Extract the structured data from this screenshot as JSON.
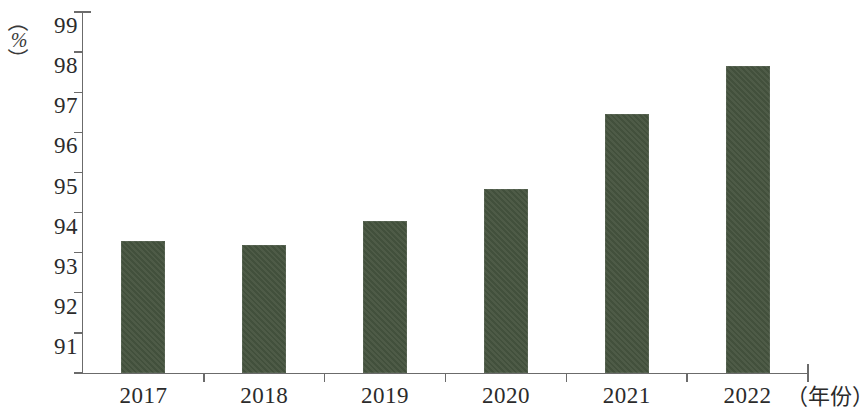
{
  "chart_data": {
    "type": "bar",
    "title": "",
    "xlabel": "（年份）",
    "ylabel": "（%）",
    "categories": [
      "2017",
      "2018",
      "2019",
      "2020",
      "2021",
      "2022"
    ],
    "values": [
      94.3,
      94.2,
      94.8,
      95.6,
      97.45,
      98.65
    ],
    "series": [
      {
        "name": "",
        "values": [
          94.3,
          94.2,
          94.8,
          95.6,
          97.45,
          98.65
        ]
      }
    ],
    "ylim": [
      91,
      100
    ],
    "ytick_labels": [
      "91",
      "92",
      "93",
      "94",
      "95",
      "96",
      "97",
      "98",
      "99",
      "100"
    ],
    "ytick_values": [
      91,
      92,
      93,
      94,
      95,
      96,
      97,
      98,
      99,
      100
    ],
    "grid": false,
    "legend": null,
    "bar_color": "#46543f",
    "axis_color": "#6b6b6b"
  },
  "axis": {
    "y_unit_open_paren": "（",
    "y_unit_symbol": "%",
    "y_unit_close_paren": "）",
    "x_unit": "（年份）"
  }
}
